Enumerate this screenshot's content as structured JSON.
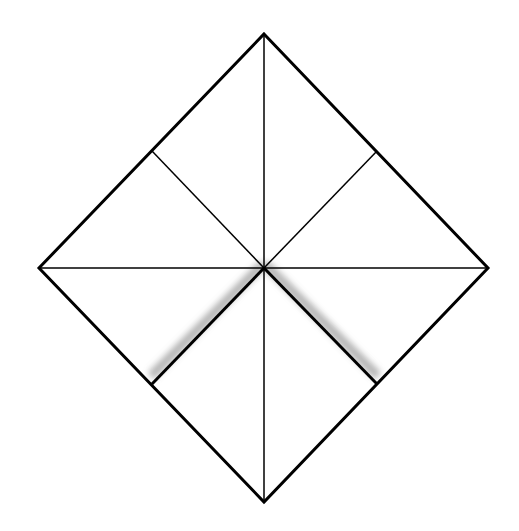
{
  "diagram": {
    "background": "#ffffff",
    "stroke_color": "#000000",
    "shadow_color": "#9a9a9a",
    "outline": {
      "points": [
        [
          264,
          34
        ],
        [
          488,
          268
        ],
        [
          264,
          502
        ],
        [
          39,
          268
        ]
      ],
      "stroke_width": 3
    },
    "center": [
      264,
      268
    ],
    "thin_lines": [
      {
        "name": "vertical-crease",
        "from": [
          264,
          34
        ],
        "to": [
          264,
          502
        ],
        "width": 1.5
      },
      {
        "name": "horizontal-crease",
        "from": [
          39,
          268
        ],
        "to": [
          488,
          268
        ],
        "width": 1.5
      },
      {
        "name": "upper-left-crease",
        "from": [
          264,
          268
        ],
        "to": [
          152,
          151
        ],
        "width": 1.5
      },
      {
        "name": "upper-right-crease",
        "from": [
          264,
          268
        ],
        "to": [
          377,
          151
        ],
        "width": 1.5
      }
    ],
    "fold_lines": [
      {
        "name": "lower-left-fold",
        "from": [
          264,
          268
        ],
        "to": [
          152,
          384
        ],
        "width": 3
      },
      {
        "name": "lower-right-fold",
        "from": [
          264,
          268
        ],
        "to": [
          377,
          384
        ],
        "width": 3
      }
    ]
  }
}
